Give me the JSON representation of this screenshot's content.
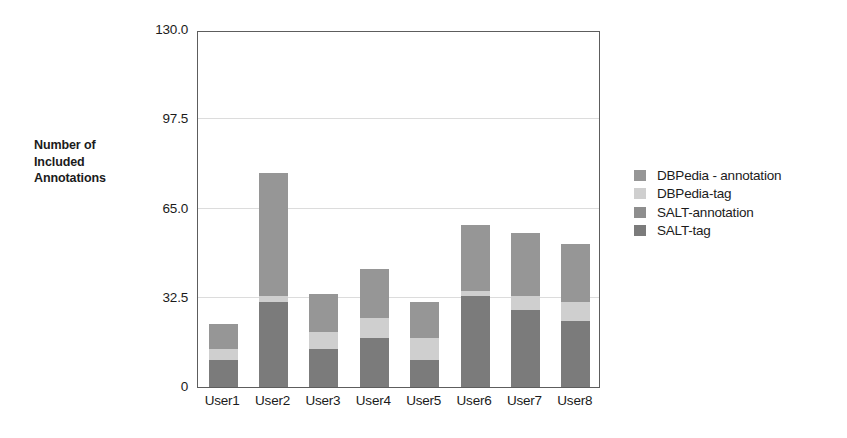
{
  "chart_data": {
    "type": "bar",
    "subtype": "stacked-vertical",
    "title": "",
    "xlabel": "",
    "ylabel": "Number of Included Annotations",
    "ylabel_lines": [
      "Number of",
      "Included",
      "Annotations"
    ],
    "categories": [
      "User1",
      "User2",
      "User3",
      "User4",
      "User5",
      "User6",
      "User7",
      "User8"
    ],
    "ytick_labels": [
      "130.0",
      "97.5",
      "65.0",
      "32.5",
      "0"
    ],
    "ytick_values": [
      130.0,
      97.5,
      65.0,
      32.5,
      0
    ],
    "ylim": [
      0,
      130
    ],
    "grid": true,
    "grid_axis": "y",
    "legend_position": "right",
    "stack_order_bottom_to_top": [
      "SALT-tag",
      "SALT-annotation",
      "DBPedia-tag",
      "DBPedia - annotation"
    ],
    "series": [
      {
        "name": "SALT-tag",
        "color": "#7b7b7b",
        "values": [
          10,
          31,
          14,
          18,
          10,
          33,
          28,
          24
        ]
      },
      {
        "name": "SALT-annotation",
        "color": "#8e8e8e",
        "values": [
          0,
          0,
          0,
          0,
          0,
          0,
          0,
          0
        ]
      },
      {
        "name": "DBPedia-tag",
        "color": "#cfcfcf",
        "values": [
          4,
          2,
          6,
          7,
          8,
          2,
          5,
          7
        ]
      },
      {
        "name": "DBPedia - annotation",
        "color": "#969696",
        "values": [
          9,
          45,
          14,
          18,
          13,
          24,
          23,
          21
        ]
      }
    ],
    "totals": [
      23,
      78,
      34,
      43,
      31,
      59,
      56,
      52
    ]
  },
  "legend": {
    "entries": [
      {
        "label": "DBPedia - annotation",
        "color": "#969696"
      },
      {
        "label": "DBPedia-tag",
        "color": "#cfcfcf"
      },
      {
        "label": "SALT-annotation",
        "color": "#8e8e8e"
      },
      {
        "label": "SALT-tag",
        "color": "#7b7b7b"
      }
    ]
  },
  "style": {
    "frame_color": "#5d5d5d",
    "grid_color": "#dcdcdc",
    "text_color": "#1b1b1b",
    "background": "#ffffff"
  }
}
